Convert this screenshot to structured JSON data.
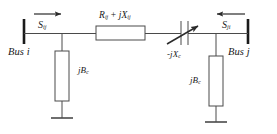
{
  "diagram": {
    "type": "transmission-line-pi-model-with-series-compensation",
    "title": "",
    "stroke_color": "#3a3a3a",
    "bus_color": "#1a1a1a",
    "text_color": "#1a1a1a",
    "background": "#ffffff"
  },
  "buses": {
    "left": {
      "label_prefix": "Bus",
      "label_index": "i",
      "label": "Bus i"
    },
    "right": {
      "label_prefix": "Bus",
      "label_index": "j",
      "label": "Bus j"
    }
  },
  "power_flows": {
    "from_i": {
      "symbol": "S",
      "subscript": "ij",
      "label": "Sij",
      "arrow_direction": "right",
      "has_overbar": true
    },
    "from_j": {
      "symbol": "S",
      "subscript": "ji",
      "label": "Sji",
      "arrow_direction": "left",
      "has_overbar": true
    }
  },
  "elements": {
    "series_impedance": {
      "symbol_r": "R",
      "subscript_r": "ij",
      "operator": " + ",
      "symbol_jx": "jX",
      "subscript_x": "ij",
      "label": "Rij + jXij",
      "shape": "rectangle"
    },
    "series_capacitor": {
      "sign": "-",
      "symbol": "jX",
      "subscript": "c",
      "label": "-jXc",
      "shape": "variable-capacitor"
    },
    "shunt_left": {
      "symbol": "jB",
      "subscript": "c",
      "label": "jBc",
      "shape": "rectangle",
      "terminates_in": "ground"
    },
    "shunt_right": {
      "symbol": "jB",
      "subscript": "c",
      "label": "jBc",
      "shape": "rectangle",
      "terminates_in": "ground"
    }
  }
}
